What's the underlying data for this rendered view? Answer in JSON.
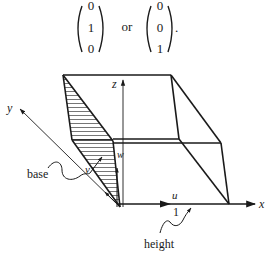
{
  "equation": {
    "vector_a": [
      "0",
      "1",
      "0"
    ],
    "connector": "or",
    "vector_b": [
      "0",
      "0",
      "1"
    ],
    "trailing": "."
  },
  "diagram": {
    "axes": {
      "x": "x",
      "y": "y",
      "z": "z"
    },
    "vectors": {
      "u": "u",
      "v": "v",
      "w": "w"
    },
    "labels": {
      "base": "base",
      "height": "height",
      "unit": "1"
    },
    "colors": {
      "ink": "#1a1a1a",
      "background": "#ffffff"
    }
  }
}
